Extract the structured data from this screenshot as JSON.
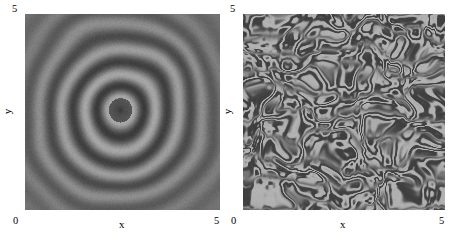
{
  "figure": {
    "background": "#ffffff",
    "width": 455,
    "height": 241
  },
  "chart_data": [
    {
      "type": "heatmap",
      "panel_id": "left",
      "title": "",
      "xlabel": "x",
      "ylabel": "y",
      "xlim": [
        0,
        5
      ],
      "ylim": [
        0,
        5
      ],
      "xticks": [
        0,
        5
      ],
      "xticklabels": [
        "0",
        "5"
      ],
      "yticks": [
        0,
        5
      ],
      "yticklabels": [
        "0",
        "5"
      ],
      "grid": false,
      "colormap": "gray",
      "pattern": "concentric-target-rings",
      "description": "Grayscale field showing concentric circular rings (target pattern) centered slightly above and left of the plot centre",
      "center": [
        2.45,
        2.55
      ],
      "ring_wavelength": 0.62,
      "ring_count": 7,
      "value_range": [
        0.0,
        1.0
      ],
      "color_dark": "#3a3a3a",
      "color_mid": "#6e6e6e",
      "color_light": "#a8a8a8",
      "noise_amplitude": 0.04
    },
    {
      "type": "heatmap",
      "panel_id": "right",
      "title": "",
      "xlabel": "x",
      "ylabel": "y",
      "xlim": [
        0,
        5
      ],
      "ylim": [
        0,
        5
      ],
      "xticks": [
        0,
        5
      ],
      "xticklabels": [
        "0",
        "5"
      ],
      "yticks": [
        0,
        5
      ],
      "yticklabels": [
        "0",
        "5"
      ],
      "grid": false,
      "colormap": "gray",
      "pattern": "labyrinthine-spiral-turbulence",
      "description": "Grayscale field showing a disordered labyrinthine / spiral-defect chaos texture of dark filaments on a light background",
      "feature_wavelength": 0.42,
      "value_range": [
        0.0,
        1.0
      ],
      "color_dark": "#3d3d3d",
      "color_mid": "#757575",
      "color_light": "#b4b4b4",
      "noise_amplitude": 0.03
    }
  ],
  "panels": {
    "left": {
      "name": "target-pattern-panel",
      "x_axis_label": "x",
      "y_axis_label": "y",
      "x_tick_min": "0",
      "x_tick_max": "5",
      "y_tick_min": "0",
      "y_tick_max": "5"
    },
    "right": {
      "name": "spiral-chaos-panel",
      "x_axis_label": "x",
      "y_axis_label": "y",
      "x_tick_min": "0",
      "x_tick_max": "5",
      "y_tick_min": "0",
      "y_tick_max": "5"
    }
  }
}
